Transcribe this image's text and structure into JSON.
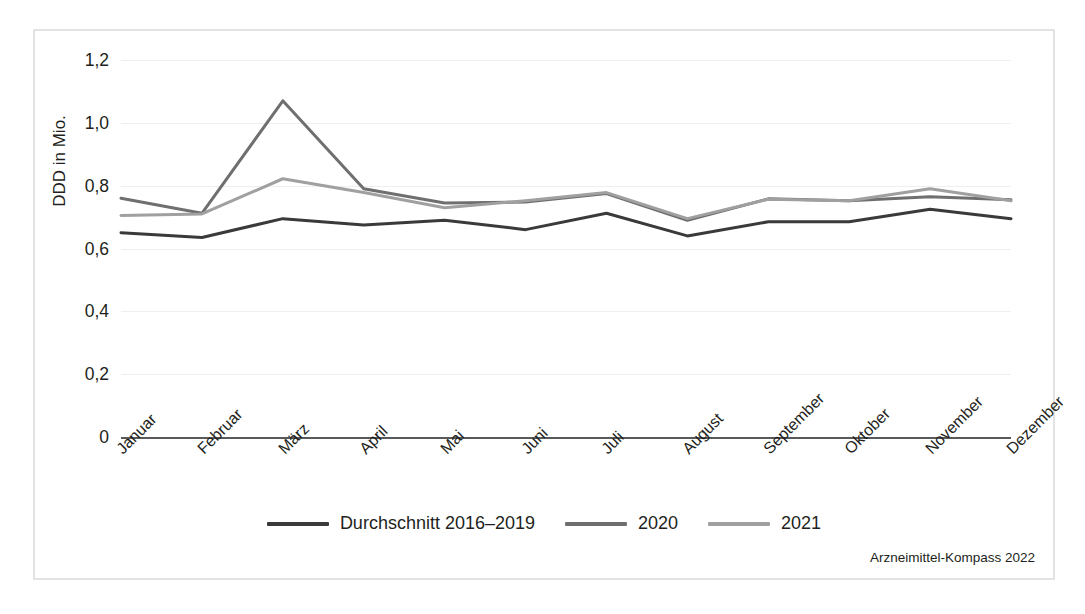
{
  "chart_data": {
    "type": "line",
    "title": "",
    "xlabel": "",
    "ylabel": "DDD in Mio.",
    "ylim": [
      0,
      1.2
    ],
    "ytick_values": [
      0,
      0.2,
      0.4,
      0.6,
      0.8,
      1.0,
      1.2
    ],
    "ytick_labels": [
      "0",
      "0,2",
      "0,4",
      "0,6",
      "0,8",
      "1,0",
      "1,2"
    ],
    "grid": true,
    "legend_position": "bottom-center",
    "categories": [
      "Januar",
      "Februar",
      "März",
      "April",
      "Mai",
      "Juni",
      "Juli",
      "August",
      "September",
      "Oktober",
      "November",
      "Dezember"
    ],
    "series": [
      {
        "name": "Durchschnitt 2016–2019",
        "color": "#3a3a3a",
        "values": [
          0.65,
          0.635,
          0.695,
          0.675,
          0.69,
          0.66,
          0.712,
          0.64,
          0.685,
          0.685,
          0.725,
          0.695
        ]
      },
      {
        "name": "2020",
        "color": "#6f6f6f",
        "values": [
          0.76,
          0.712,
          1.07,
          0.79,
          0.745,
          0.748,
          0.775,
          0.69,
          0.758,
          0.752,
          0.765,
          0.755
        ]
      },
      {
        "name": "2021",
        "color": "#a0a0a0",
        "values": [
          0.705,
          0.71,
          0.822,
          0.778,
          0.73,
          0.752,
          0.778,
          0.695,
          0.757,
          0.752,
          0.79,
          0.752
        ]
      }
    ],
    "source": "Arzneimittel-Kompass 2022"
  },
  "legend": {
    "items": [
      {
        "label": "Durchschnitt 2016–2019",
        "color": "#3a3a3a"
      },
      {
        "label": "2020",
        "color": "#6f6f6f"
      },
      {
        "label": "2021",
        "color": "#a0a0a0"
      }
    ]
  },
  "source_note": "Arzneimittel-Kompass 2022",
  "colors": {
    "frame": "#e3e3e3",
    "gridline": "#efefef",
    "axis": "#58595b",
    "text": "#231f20"
  }
}
